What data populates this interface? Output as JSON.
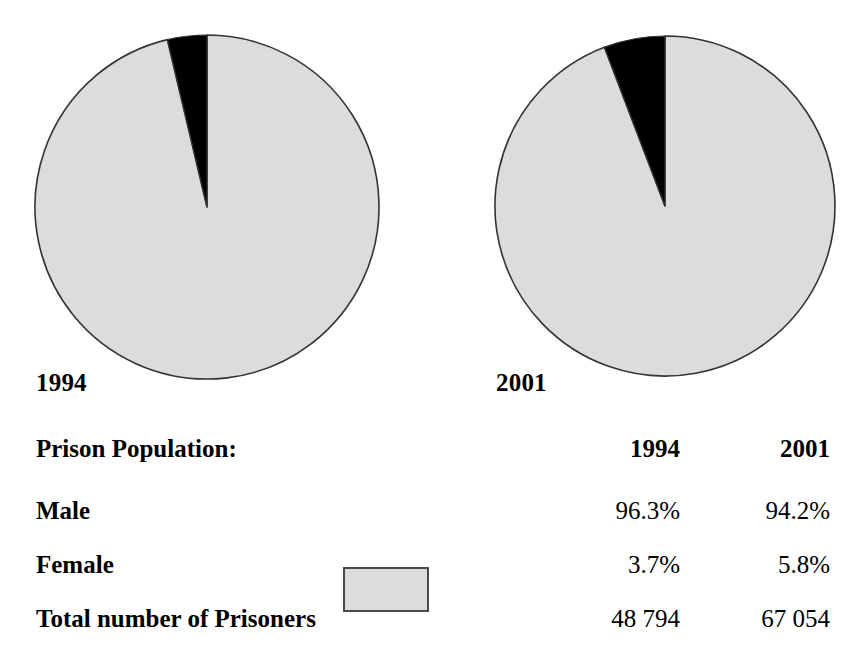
{
  "chart_data": {
    "type": "pie",
    "title": "Prison Population:",
    "charts": [
      {
        "label": "1994",
        "categories": [
          "Male",
          "Female"
        ],
        "values": [
          96.3,
          3.7
        ],
        "value_labels": [
          "96.3%",
          "3.7%"
        ],
        "total_label": "48 794",
        "total": 48794,
        "colors": [
          "#dcdcdc",
          "#000000"
        ],
        "start_angle_deg": 0,
        "direction": "counterclockwise"
      },
      {
        "label": "2001",
        "categories": [
          "Male",
          "Female"
        ],
        "values": [
          94.2,
          5.8
        ],
        "value_labels": [
          "94.2%",
          "5.8%"
        ],
        "total_label": "67 054",
        "total": 67054,
        "colors": [
          "#dcdcdc",
          "#000000"
        ],
        "start_angle_deg": 0,
        "direction": "counterclockwise"
      }
    ],
    "legend": {
      "position": "below-center",
      "entries": [
        {
          "name": "Male",
          "color": "#dcdcdc"
        },
        {
          "name": "Female",
          "color": "#000000"
        }
      ]
    },
    "grid": false,
    "xlabel": "",
    "ylabel": ""
  },
  "pies": {
    "left": {
      "caption": "1994",
      "center_x": 207,
      "center_y": 207,
      "radius": 172,
      "male_pct": 96.3,
      "female_pct": 3.7
    },
    "right": {
      "caption": "2001",
      "center_x": 665,
      "center_y": 206,
      "radius": 170,
      "male_pct": 94.2,
      "female_pct": 5.8
    }
  },
  "table": {
    "header": {
      "title": "Prison Population:",
      "col1994": "1994",
      "col2001": "2001"
    },
    "rows": [
      {
        "label": "Male",
        "v1994": "96.3%",
        "v2001": "94.2%",
        "swatch": "gray-swatch"
      },
      {
        "label": "Female",
        "v1994": "3.7%",
        "v2001": "5.8%",
        "swatch": "black-swatch"
      },
      {
        "label": "Total number of Prisoners",
        "v1994": "48 794",
        "v2001": "67 054",
        "swatch": null
      }
    ]
  },
  "colors": {
    "male_fill": "#dcdcdc",
    "female_fill": "#000000",
    "outline": "#333333",
    "background": "#ffffff",
    "text": "#000000"
  }
}
